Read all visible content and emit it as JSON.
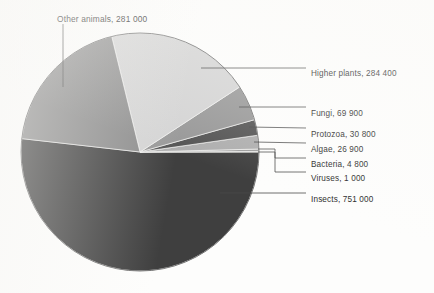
{
  "chart_data": {
    "type": "pie",
    "title": "",
    "subtitle": "",
    "xlabel": "",
    "ylabel": "",
    "legend_position": "callout-labels",
    "grid": false,
    "total": 1449800,
    "units": "described species",
    "categories": [
      "Insects",
      "Higher plants",
      "Other animals",
      "Fungi",
      "Protozoa",
      "Algae",
      "Bacteria",
      "Viruses"
    ],
    "values": [
      751000,
      284400,
      281000,
      69900,
      30800,
      26900,
      4800,
      1000
    ],
    "slices": [
      {
        "name": "Insects",
        "value": 751000,
        "value_text": "751 000",
        "label": "Insects, 751 000",
        "color": "#3f3f3f",
        "percent": 51.8,
        "start_angle_deg": 0.0,
        "end_angle_deg": -186.5,
        "label_x": 311,
        "label_y": 196,
        "leader_from_x": 220,
        "leader_from_y": 193,
        "leader_to_x": 306,
        "leader_to_y": 193
      },
      {
        "name": "Viruses",
        "value": 1000,
        "value_text": "1 000",
        "label": "Viruses, 1 000",
        "color": "#e9e9e9",
        "percent": 0.07,
        "start_angle_deg": 0.0,
        "end_angle_deg": 0.25,
        "label_x": 311,
        "label_y": 175,
        "leader_from_x": 258,
        "leader_from_y": 152,
        "leader_to_x": 306,
        "leader_to_y": 172
      },
      {
        "name": "Bacteria",
        "value": 4800,
        "value_text": "4 800",
        "label": "Bacteria, 4 800",
        "color": "#9d9d9d",
        "percent": 0.33,
        "start_angle_deg": 0.25,
        "end_angle_deg": 1.44,
        "label_x": 311,
        "label_y": 161,
        "leader_from_x": 258,
        "leader_from_y": 149,
        "leader_to_x": 306,
        "leader_to_y": 158
      },
      {
        "name": "Algae",
        "value": 26900,
        "value_text": "26 900",
        "label": "Algae, 26 900",
        "color": "#aeaeae",
        "percent": 1.86,
        "start_angle_deg": 1.44,
        "end_angle_deg": 8.12,
        "label_x": 311,
        "label_y": 146,
        "leader_from_x": 254,
        "leader_from_y": 142,
        "leader_to_x": 306,
        "leader_to_y": 143
      },
      {
        "name": "Protozoa",
        "value": 30800,
        "value_text": "30 800",
        "label": "Protozoa, 30 800",
        "color": "#545454",
        "percent": 2.12,
        "start_angle_deg": 8.12,
        "end_angle_deg": 15.77,
        "label_x": 311,
        "label_y": 131,
        "leader_from_x": 249,
        "leader_from_y": 127,
        "leader_to_x": 306,
        "leader_to_y": 128
      },
      {
        "name": "Fungi",
        "value": 69900,
        "value_text": "69 900",
        "label": "Fungi, 69 900",
        "color": "#989898",
        "percent": 4.82,
        "start_angle_deg": 15.77,
        "end_angle_deg": 33.13,
        "label_x": 311,
        "label_y": 110,
        "leader_from_x": 239,
        "leader_from_y": 107,
        "leader_to_x": 306,
        "leader_to_y": 107
      },
      {
        "name": "Higher plants",
        "value": 284400,
        "value_text": "284 400",
        "label": "Higher plants, 284 400",
        "color": "#d4d4d4",
        "percent": 19.62,
        "start_angle_deg": 33.13,
        "end_angle_deg": 103.76,
        "label_x": 311,
        "label_y": 70,
        "leader_from_x": 201,
        "leader_from_y": 68,
        "leader_to_x": 306,
        "leader_to_y": 68
      },
      {
        "name": "Other animals",
        "value": 281000,
        "value_text": "281 000",
        "label": "Other animals, 281 000",
        "color": "#8d8d8d",
        "percent": 19.38,
        "start_angle_deg": 103.76,
        "end_angle_deg": 173.55,
        "label_x": 57,
        "label_y": 15,
        "leader_from_x": 63,
        "leader_from_y": 87,
        "leader_to_x": 63,
        "leader_to_y": 24
      }
    ],
    "geometry": {
      "center_x": 140,
      "center_y": 152,
      "radius": 119
    },
    "colors": {
      "outline": "#6b6b6b",
      "leader_line": "#4a4a4a",
      "text": "#2a2a2a",
      "background": "#fdfdfc"
    }
  }
}
